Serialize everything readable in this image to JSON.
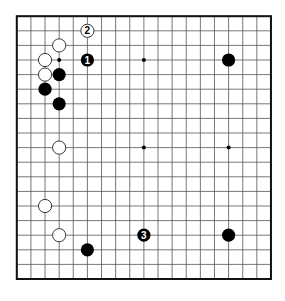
{
  "board": {
    "size": 19,
    "origin_x": 16.8,
    "origin_y": 16.2,
    "spacing_x": 14.12,
    "spacing_y": 14.6,
    "stone_radius": 6.6,
    "line_color": "#555555",
    "border_color": "#111111",
    "background": "#ffffff",
    "black_color": "#000000",
    "white_fill": "#ffffff",
    "white_stroke": "#222222",
    "star_points": [
      [
        3,
        3
      ],
      [
        9,
        3
      ],
      [
        15,
        3
      ],
      [
        3,
        9
      ],
      [
        9,
        9
      ],
      [
        15,
        9
      ],
      [
        3,
        15
      ],
      [
        9,
        15
      ],
      [
        15,
        15
      ]
    ]
  },
  "stones": [
    {
      "color": "white",
      "col": 5,
      "row": 1,
      "label": "2"
    },
    {
      "color": "black",
      "col": 5,
      "row": 3,
      "label": "1"
    },
    {
      "color": "white",
      "col": 3,
      "row": 2,
      "label": ""
    },
    {
      "color": "white",
      "col": 2,
      "row": 3,
      "label": ""
    },
    {
      "color": "white",
      "col": 2,
      "row": 4,
      "label": ""
    },
    {
      "color": "black",
      "col": 3,
      "row": 4,
      "label": ""
    },
    {
      "color": "black",
      "col": 2,
      "row": 5,
      "label": ""
    },
    {
      "color": "black",
      "col": 3,
      "row": 6,
      "label": ""
    },
    {
      "color": "black",
      "col": 15,
      "row": 3,
      "label": ""
    },
    {
      "color": "white",
      "col": 3,
      "row": 9,
      "label": ""
    },
    {
      "color": "white",
      "col": 2,
      "row": 13,
      "label": ""
    },
    {
      "color": "white",
      "col": 3,
      "row": 15,
      "label": ""
    },
    {
      "color": "black",
      "col": 5,
      "row": 16,
      "label": ""
    },
    {
      "color": "black",
      "col": 9,
      "row": 15,
      "label": "3"
    },
    {
      "color": "black",
      "col": 15,
      "row": 15,
      "label": ""
    }
  ]
}
